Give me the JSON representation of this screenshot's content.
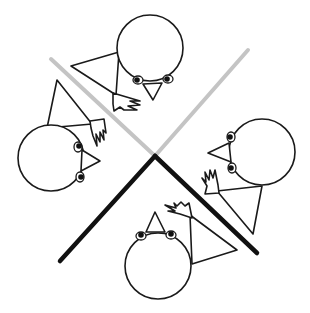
{
  "illustration": {
    "description": "Four stick-like figures with round heads arranged around an X formed by two gray and two black bars",
    "colors": {
      "background": "#ffffff",
      "outline": "#1a1a1a",
      "gray_bar": "#c4c4c4",
      "black_bar": "#111111"
    },
    "bars": [
      {
        "name": "gray-bar-left",
        "from": [
          51,
          59
        ],
        "to": [
          155,
          156
        ],
        "color": "gray"
      },
      {
        "name": "gray-bar-right",
        "from": [
          248,
          50
        ],
        "to": [
          155,
          156
        ],
        "color": "gray"
      },
      {
        "name": "black-bar-left",
        "from": [
          155,
          156
        ],
        "to": [
          60,
          261
        ],
        "color": "black"
      },
      {
        "name": "black-bar-right",
        "from": [
          155,
          156
        ],
        "to": [
          257,
          253
        ],
        "color": "black"
      }
    ],
    "figures": [
      {
        "name": "top-figure",
        "head_center": [
          150,
          48
        ],
        "head_radius": 33,
        "facing": "down"
      },
      {
        "name": "left-figure",
        "head_center": [
          51,
          158
        ],
        "head_radius": 33,
        "facing": "right"
      },
      {
        "name": "right-figure",
        "head_center": [
          262,
          152
        ],
        "head_radius": 33,
        "facing": "left"
      },
      {
        "name": "bottom-figure",
        "head_center": [
          158,
          266
        ],
        "head_radius": 33,
        "facing": "up"
      }
    ]
  }
}
